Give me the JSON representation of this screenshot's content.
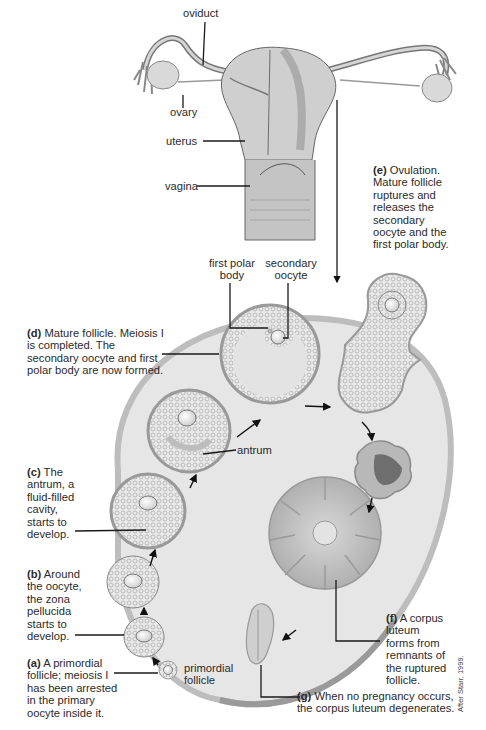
{
  "anatomy_labels": {
    "oviduct": "oviduct",
    "ovary": "ovary",
    "uterus": "uterus",
    "vagina": "vagina"
  },
  "stages": {
    "a": {
      "tag": "(a)",
      "text": "A primordial follicle; meiosis I has been arrested in the primary oocyte inside it."
    },
    "b": {
      "tag": "(b)",
      "text": "Around the oocyte, the zona pellucida starts to develop."
    },
    "c": {
      "tag": "(c)",
      "text": "The antrum, a fluid-filled cavity, starts to develop."
    },
    "d": {
      "tag": "(d)",
      "text": "Mature follicle. Meiosis I is completed. The secondary oocyte and first polar body are now formed."
    },
    "e": {
      "tag": "(e)",
      "text": "Ovulation. Mature follicle ruptures and releases the secondary oocyte and the first polar body."
    },
    "f": {
      "tag": "(f)",
      "text": "A corpus luteum forms from remnants of the ruptured follicle."
    },
    "g": {
      "tag": "(g)",
      "text": "When no pregnancy occurs, the corpus luteum degenerates."
    }
  },
  "structure_labels": {
    "first_polar_body": "first polar body",
    "secondary_oocyte": "secondary oocyte",
    "antrum": "antrum",
    "primordial_follicle": "primordial follicle"
  },
  "credit": "After Starr, 1999.",
  "colors": {
    "ovary_fill": "#e6e6e6",
    "ovary_edge": "#bdbdbd",
    "follicle_ring": "#a9a9a9",
    "corpus_luteum": "#b8b8b8",
    "blood": "#6e6e6e",
    "leader_line": "#1a1a1a"
  }
}
